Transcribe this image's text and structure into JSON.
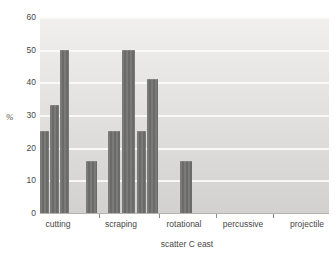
{
  "chart_data": {
    "type": "bar",
    "title": "",
    "xlabel": "scatter C east",
    "ylabel": "%",
    "ylim": [
      0,
      60
    ],
    "yticks": [
      0,
      10,
      20,
      30,
      40,
      50,
      60
    ],
    "categories": [
      "cutting",
      "scraping",
      "rotational",
      "percussive",
      "projectile"
    ],
    "series": {
      "cutting": [
        25,
        33,
        50,
        16
      ],
      "scraping": [
        25,
        50,
        25,
        41
      ],
      "rotational": [
        16
      ],
      "percussive": [],
      "projectile": []
    },
    "bars": [
      {
        "category": "cutting",
        "value": 25,
        "x0": 40,
        "x1": 49
      },
      {
        "category": "cutting",
        "value": 33,
        "x0": 50,
        "x1": 59
      },
      {
        "category": "cutting",
        "value": 50,
        "x0": 60,
        "x1": 69
      },
      {
        "category": "cutting",
        "value": 16,
        "x0": 86,
        "x1": 97
      },
      {
        "category": "scraping",
        "value": 25,
        "x0": 108,
        "x1": 120
      },
      {
        "category": "scraping",
        "value": 50,
        "x0": 122,
        "x1": 135
      },
      {
        "category": "scraping",
        "value": 25,
        "x0": 137,
        "x1": 146
      },
      {
        "category": "scraping",
        "value": 41,
        "x0": 147,
        "x1": 158
      },
      {
        "category": "rotational",
        "value": 16,
        "x0": 180,
        "x1": 192
      }
    ],
    "grid": "horizontal-white-lines",
    "legend": null,
    "layout": {
      "plot": {
        "left": 40,
        "top": 17,
        "width": 289,
        "height": 196
      },
      "category_ticks_x": [
        99,
        159,
        216,
        273
      ],
      "category_label_centers_x": [
        58,
        121,
        184,
        243,
        307
      ],
      "category_labels_y": 220,
      "xlabel_center_x": 187,
      "xlabel_y": 240,
      "ylabel_x": 6,
      "ylabel_y": 113
    },
    "colors": {
      "bar": "#6f6f6d",
      "plot_bg_top": "#f1f0ee",
      "plot_bg_bottom": "#d2d1cf",
      "gridline": "#fbfbfa",
      "text": "#474747",
      "tick": "#8d8d8b",
      "baseline": "#b3b3b0"
    }
  }
}
